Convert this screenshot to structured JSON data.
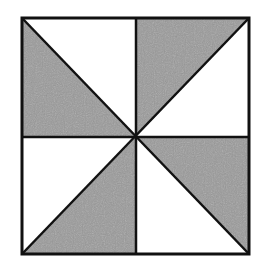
{
  "diagram": {
    "type": "pinwheel-square",
    "colors": {
      "shade": "#9a9a9a",
      "line": "#111111",
      "background": "#ffffff"
    },
    "square": {
      "x": 22,
      "y": 18,
      "w": 227,
      "h": 236
    },
    "center": {
      "x": 136,
      "y": 137
    },
    "shaded_triangles": [
      {
        "name": "top-left",
        "points": "22,18 22,137 136,137"
      },
      {
        "name": "top-right",
        "points": "136,18 249,18 136,137"
      },
      {
        "name": "bottom-right",
        "points": "136,137 249,137 249,254"
      },
      {
        "name": "bottom-left",
        "points": "136,137 136,254 22,254"
      }
    ]
  }
}
